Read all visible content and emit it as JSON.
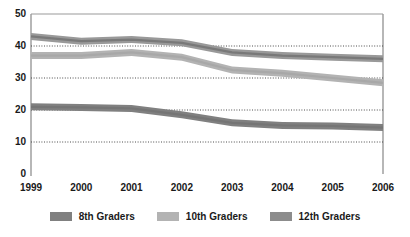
{
  "chart_data": {
    "type": "line",
    "title": "",
    "subtitle": "",
    "xlabel": "",
    "ylabel": "",
    "categories": [
      "1999",
      "2000",
      "2001",
      "2002",
      "2003",
      "2004",
      "2005",
      "2006"
    ],
    "x_tick_labels": [
      "1999",
      "2000",
      "2001",
      "2002",
      "2003",
      "2004",
      "2005",
      "2006"
    ],
    "y_tick_labels": [
      "0",
      "10",
      "20",
      "30",
      "40",
      "50"
    ],
    "y_tick_values": [
      0,
      10,
      20,
      30,
      40,
      50
    ],
    "ylim": [
      0,
      50
    ],
    "grid": "horizontal-dotted",
    "gridlines_at": [
      10,
      20,
      30,
      40
    ],
    "legend_position": "bottom-center",
    "series": [
      {
        "name": "8th Graders",
        "color": "#808080",
        "values": [
          21.0,
          20.8,
          20.5,
          18.5,
          16.0,
          15.2,
          15.0,
          14.5
        ]
      },
      {
        "name": "10th Graders",
        "color": "#b3b3b3",
        "values": [
          37.0,
          37.0,
          38.0,
          36.5,
          32.5,
          31.5,
          30.0,
          28.5
        ]
      },
      {
        "name": "12th Graders",
        "color": "#999999",
        "values": [
          43.0,
          41.5,
          42.0,
          41.0,
          38.0,
          37.0,
          36.5,
          36.0
        ]
      }
    ]
  },
  "legend": {
    "items": [
      {
        "label": "8th Graders",
        "color": "#808080"
      },
      {
        "label": "10th Graders",
        "color": "#b3b3b3"
      },
      {
        "label": "12th Graders",
        "color": "#8c8c8c"
      }
    ]
  },
  "axes": {
    "axis_color": "#999999",
    "grid_color": "#4d4d4d",
    "tick_text_color": "#1a1a1a"
  }
}
